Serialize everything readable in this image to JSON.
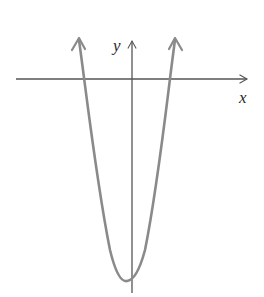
{
  "diagram": {
    "type": "function-graph",
    "axes": {
      "x_label": "x",
      "y_label": "y",
      "axis_color": "#555555"
    },
    "curve": {
      "kind": "parabola",
      "opens": "up",
      "color": "#8a8a8a",
      "x_intercepts": "two (one left, one right of y-axis)",
      "vertex_position": "below x-axis, slightly left of y-axis"
    }
  }
}
